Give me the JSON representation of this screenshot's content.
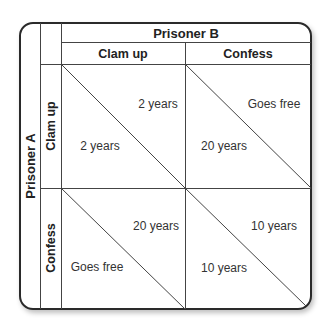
{
  "title_columns": "Prisoner B",
  "title_rows": "Prisoner A",
  "columns": [
    "Clam up",
    "Confess"
  ],
  "rows": [
    "Clam up",
    "Confess"
  ],
  "cells": [
    [
      {
        "b_payoff": "2 years",
        "a_payoff": "2 years"
      },
      {
        "b_payoff": "Goes free",
        "a_payoff": "20 years"
      }
    ],
    [
      {
        "b_payoff": "20 years",
        "a_payoff": "Goes free"
      },
      {
        "b_payoff": "10 years",
        "a_payoff": "10 years"
      }
    ]
  ],
  "colors": {
    "line": "#444444",
    "border": "#2a2a2a",
    "text": "#222222"
  }
}
